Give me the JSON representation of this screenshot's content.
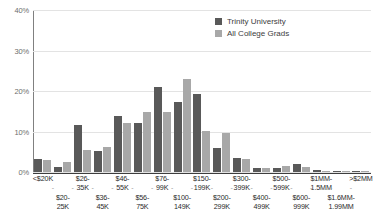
{
  "chart_data": {
    "type": "bar",
    "title": "",
    "xlabel": "",
    "ylabel": "",
    "ylim": [
      0,
      40
    ],
    "ytick_labels": [
      "0%",
      "10%",
      "20%",
      "30%",
      "40%"
    ],
    "ytick_values": [
      0,
      10,
      20,
      30,
      40
    ],
    "grid": true,
    "legend_position": "top-right",
    "categories": [
      "<$20K",
      "$20-25K",
      "$26-35K",
      "$36-45K",
      "$46-55K",
      "$56-75K",
      "$76-99K",
      "$100-149K",
      "$150-199K",
      "$200-299K",
      "$300-399K",
      "$400-499K",
      "$500-599K",
      "$600-999K",
      "$1MM-1.5MM",
      "$1.6MM-1.99MM",
      ">$2MM"
    ],
    "category_rows": [
      "a",
      "b",
      "a",
      "b",
      "a",
      "b",
      "a",
      "b",
      "a",
      "b",
      "a",
      "b",
      "a",
      "b",
      "a",
      "b",
      "a"
    ],
    "series": [
      {
        "name": "Trinity University",
        "color": "#595959",
        "values": [
          3.3,
          1.3,
          11.5,
          5.2,
          13.8,
          12.0,
          21.0,
          17.2,
          19.2,
          6.0,
          3.4,
          1.0,
          1.0,
          2.0,
          0.4,
          0.2,
          0.3
        ]
      },
      {
        "name": "All College Grads",
        "color": "#a8a8a8",
        "values": [
          2.9,
          2.4,
          5.5,
          6.3,
          12.0,
          14.8,
          14.7,
          22.9,
          10.2,
          9.6,
          3.2,
          1.0,
          1.6,
          1.2,
          0.3,
          0.2,
          0.2
        ]
      }
    ]
  },
  "legend": {
    "entries": [
      {
        "label": "Trinity University"
      },
      {
        "label": "All College Grads"
      }
    ]
  },
  "axis": {
    "dash": "-"
  }
}
